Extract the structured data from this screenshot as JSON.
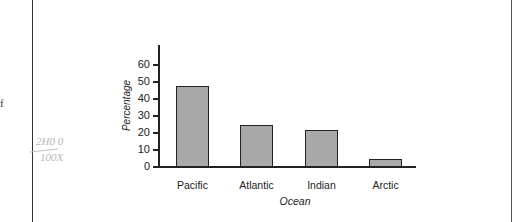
{
  "page": {
    "margin_text": "f",
    "handwriting": [
      "2H0 0",
      "100X"
    ]
  },
  "chart_data": {
    "type": "bar",
    "title": "",
    "xlabel": "Ocean",
    "ylabel": "Percentage",
    "categories": [
      "Pacific",
      "Atlantic",
      "Indian",
      "Arctic"
    ],
    "values": [
      47,
      24,
      21,
      4
    ],
    "ylim": [
      0,
      70
    ],
    "yticks": [
      0,
      10,
      20,
      30,
      40,
      50,
      60
    ],
    "grid": false,
    "legend": null,
    "bar_color": "#a8a8a8"
  }
}
